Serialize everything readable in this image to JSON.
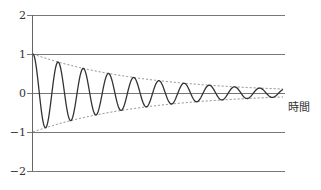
{
  "chart_data": {
    "type": "line",
    "title": "",
    "xlabel": "時間",
    "ylabel": "",
    "ylim": [
      -2,
      2
    ],
    "yticks": [
      2,
      1,
      0,
      -1,
      -2
    ],
    "ytick_labels": [
      "2",
      "1",
      "0",
      "−1",
      "−2"
    ],
    "grid": true,
    "legend": null,
    "series": [
      {
        "name": "damped-oscillation",
        "style": "solid",
        "formula": "exp(-k t) * cos(ω t)",
        "initial_amplitude": 1,
        "cycles_shown": 10,
        "final_amplitude_approx": 0.1
      },
      {
        "name": "upper-envelope",
        "style": "dashed",
        "formula": "exp(-k t)"
      },
      {
        "name": "lower-envelope",
        "style": "dashed",
        "formula": "-exp(-k t)"
      }
    ]
  },
  "colors": {
    "curve": "#333333",
    "grid": "#777777",
    "envelope": "#777777"
  }
}
